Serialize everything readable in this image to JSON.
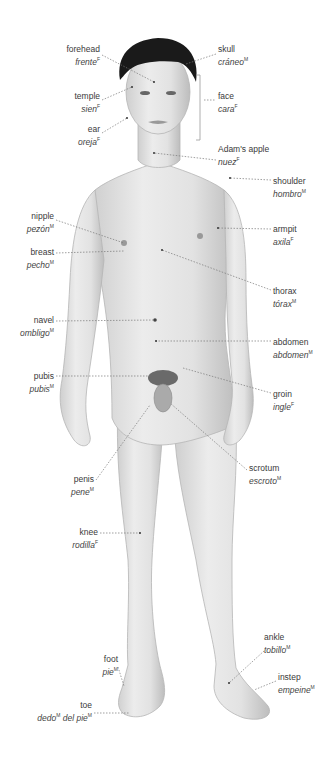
{
  "diagram": {
    "labels": [
      {
        "id": "forehead",
        "en": "forehead",
        "es": "frente",
        "gender": "F",
        "side": "left",
        "x": 38,
        "y": 44,
        "w": 62
      },
      {
        "id": "temple",
        "en": "temple",
        "es": "sien",
        "gender": "F",
        "side": "left",
        "x": 38,
        "y": 91,
        "w": 62
      },
      {
        "id": "ear",
        "en": "ear",
        "es": "oreja",
        "gender": "F",
        "side": "left",
        "x": 38,
        "y": 124,
        "w": 62
      },
      {
        "id": "nipple",
        "en": "nipple",
        "es": "pezón",
        "gender": "M",
        "side": "left",
        "x": 0,
        "y": 211,
        "w": 54
      },
      {
        "id": "breast",
        "en": "breast",
        "es": "pecho",
        "gender": "M",
        "side": "left",
        "x": 0,
        "y": 247,
        "w": 54
      },
      {
        "id": "navel",
        "en": "navel",
        "es": "ombligo",
        "gender": "M",
        "side": "left",
        "x": 0,
        "y": 315,
        "w": 54
      },
      {
        "id": "pubis",
        "en": "pubis",
        "es": "pubis",
        "gender": "M",
        "side": "left",
        "x": 0,
        "y": 371,
        "w": 54
      },
      {
        "id": "penis",
        "en": "penis",
        "es": "pene",
        "gender": "M",
        "side": "left",
        "x": 40,
        "y": 474,
        "w": 54
      },
      {
        "id": "knee",
        "en": "knee",
        "es": "rodilla",
        "gender": "F",
        "side": "left",
        "x": 40,
        "y": 527,
        "w": 58
      },
      {
        "id": "foot",
        "en": "foot",
        "es": "pie",
        "gender": "M",
        "side": "left",
        "x": 60,
        "y": 654,
        "w": 58
      },
      {
        "id": "toe",
        "en": "toe",
        "es": "dedo",
        "gender": "M",
        "es_suffix": "del pie",
        "gender2": "M",
        "side": "left",
        "x": 20,
        "y": 700,
        "w": 72
      },
      {
        "id": "skull",
        "en": "skull",
        "es": "cráneo",
        "gender": "M",
        "side": "right",
        "x": 218,
        "y": 44
      },
      {
        "id": "face",
        "en": "face",
        "es": "cara",
        "gender": "F",
        "side": "right",
        "x": 218,
        "y": 91
      },
      {
        "id": "adams-apple",
        "en": "Adam's apple",
        "es": "nuez",
        "gender": "F",
        "side": "right",
        "x": 218,
        "y": 144
      },
      {
        "id": "shoulder",
        "en": "shoulder",
        "es": "hombro",
        "gender": "M",
        "side": "right",
        "x": 273,
        "y": 176
      },
      {
        "id": "armpit",
        "en": "armpit",
        "es": "axila",
        "gender": "F",
        "side": "right",
        "x": 273,
        "y": 224
      },
      {
        "id": "thorax",
        "en": "thorax",
        "es": "tórax",
        "gender": "M",
        "side": "right",
        "x": 273,
        "y": 286
      },
      {
        "id": "abdomen",
        "en": "abdomen",
        "es": "abdomen",
        "gender": "M",
        "side": "right",
        "x": 273,
        "y": 337
      },
      {
        "id": "groin",
        "en": "groin",
        "es": "ingle",
        "gender": "F",
        "side": "right",
        "x": 273,
        "y": 389
      },
      {
        "id": "scrotum",
        "en": "scrotum",
        "es": "escroto",
        "gender": "M",
        "side": "right",
        "x": 249,
        "y": 463
      },
      {
        "id": "ankle",
        "en": "ankle",
        "es": "tobillo",
        "gender": "M",
        "side": "right",
        "x": 264,
        "y": 632
      },
      {
        "id": "instep",
        "en": "instep",
        "es": "empeine",
        "gender": "M",
        "side": "right",
        "x": 278,
        "y": 672
      }
    ]
  }
}
